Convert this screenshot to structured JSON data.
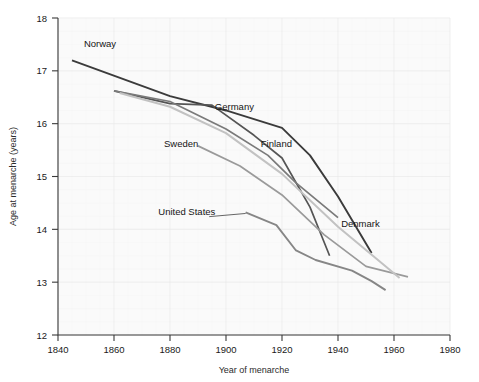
{
  "chart_data": {
    "type": "line",
    "title": "",
    "xlabel": "Year of menarche",
    "ylabel": "Age at menarche (years)",
    "xlim": [
      1840,
      1980
    ],
    "ylim": [
      12,
      18
    ],
    "xticks": [
      1840,
      1860,
      1880,
      1900,
      1920,
      1940,
      1960,
      1980
    ],
    "yticks": [
      12,
      13,
      14,
      15,
      16,
      17,
      18
    ],
    "xtick_labels": [
      "1840",
      "1860",
      "1880",
      "1900",
      "1920",
      "1940",
      "1960",
      "1980"
    ],
    "ytick_labels": [
      "12",
      "13",
      "14",
      "15",
      "16",
      "17",
      "18"
    ],
    "grid": true,
    "legend": "inline-labels",
    "series": [
      {
        "name": "Norway",
        "color": "#3b3b3b",
        "width": 1.9,
        "label_x": 1855,
        "label_y": 17.45,
        "points": [
          [
            1845,
            17.2
          ],
          [
            1880,
            16.52
          ],
          [
            1900,
            16.25
          ],
          [
            1920,
            15.92
          ],
          [
            1930,
            15.4
          ],
          [
            1940,
            14.62
          ],
          [
            1952,
            13.55
          ]
        ]
      },
      {
        "name": "Germany",
        "color": "#555555",
        "width": 1.7,
        "label_x": 1903,
        "label_y": 16.25,
        "points": [
          [
            1860,
            16.62
          ],
          [
            1880,
            16.38
          ],
          [
            1895,
            16.35
          ],
          [
            1910,
            15.78
          ],
          [
            1920,
            15.35
          ],
          [
            1930,
            14.42
          ],
          [
            1937,
            13.5
          ]
        ]
      },
      {
        "name": "Sweden",
        "color": "#9a9a9a",
        "width": 1.7,
        "label_x": 1884,
        "label_y": 15.55,
        "points": [
          [
            1890,
            15.58
          ],
          [
            1905,
            15.2
          ],
          [
            1920,
            14.65
          ],
          [
            1935,
            13.9
          ],
          [
            1950,
            13.3
          ],
          [
            1965,
            13.1
          ]
        ]
      },
      {
        "name": "Finland",
        "color": "#7a7a7a",
        "width": 1.7,
        "label_x": 1918,
        "label_y": 15.55,
        "points": [
          [
            1860,
            16.62
          ],
          [
            1880,
            16.42
          ],
          [
            1900,
            15.9
          ],
          [
            1915,
            15.4
          ],
          [
            1925,
            14.88
          ],
          [
            1940,
            14.22
          ]
        ]
      },
      {
        "name": "Denmark",
        "color": "#c2c2c2",
        "width": 2.0,
        "label_x": 1948,
        "label_y": 14.05,
        "points": [
          [
            1862,
            16.58
          ],
          [
            1880,
            16.32
          ],
          [
            1900,
            15.82
          ],
          [
            1920,
            15.05
          ],
          [
            1940,
            14.05
          ],
          [
            1962,
            13.08
          ]
        ]
      },
      {
        "name": "United States",
        "color": "#868686",
        "width": 1.9,
        "label_x": 1886,
        "label_y": 14.28,
        "points": [
          [
            1907,
            14.32
          ],
          [
            1918,
            14.08
          ],
          [
            1925,
            13.6
          ],
          [
            1932,
            13.42
          ],
          [
            1945,
            13.22
          ],
          [
            1952,
            13.02
          ],
          [
            1957,
            12.85
          ]
        ]
      }
    ],
    "leader_lines": [
      {
        "name": "united-states-leader",
        "x1": 1894,
        "y1": 14.24,
        "x2": 1907,
        "y2": 14.3
      }
    ]
  }
}
